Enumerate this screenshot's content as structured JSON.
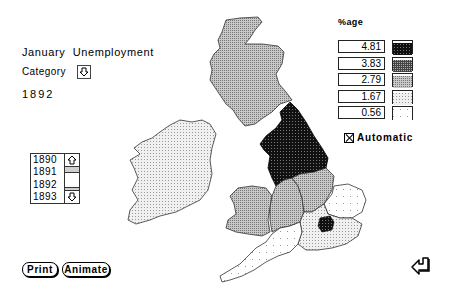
{
  "header": {
    "title_line1": "January  Unemployment",
    "title_line2": "1892"
  },
  "category": {
    "label": "Category",
    "icon": "down-arrow-icon"
  },
  "legend": {
    "title": "%age",
    "rows": [
      {
        "value": "4.81",
        "fill": "#1a1a1a"
      },
      {
        "value": "3.83",
        "fill": "#3d3d3d"
      },
      {
        "value": "2.79",
        "fill": "#9a9a9a"
      },
      {
        "value": "1.67",
        "fill": "#dcdcdc"
      },
      {
        "value": "0.56",
        "fill": "#f7f7f7"
      }
    ],
    "automatic": {
      "label": "Automatic",
      "checked": true
    }
  },
  "years": {
    "items": [
      "1890",
      "1891",
      "1892",
      "1893"
    ],
    "selected": "1892"
  },
  "buttons": {
    "print": "Print",
    "animate": "Animate"
  },
  "map": {
    "regions": [
      {
        "name": "Scotland",
        "value": "2.79"
      },
      {
        "name": "Ireland",
        "value": "1.67"
      },
      {
        "name": "North England",
        "value": "4.81"
      },
      {
        "name": "Wales",
        "value": "2.79"
      },
      {
        "name": "Midlands",
        "value": "2.79"
      },
      {
        "name": "East Midlands",
        "value": "2.79"
      },
      {
        "name": "East Anglia",
        "value": "0.56"
      },
      {
        "name": "South West",
        "value": "0.56"
      },
      {
        "name": "South East",
        "value": "1.67"
      },
      {
        "name": "London",
        "value": "3.83"
      }
    ]
  },
  "colors": {
    "background": "#ffffff",
    "ink": "#000000"
  }
}
